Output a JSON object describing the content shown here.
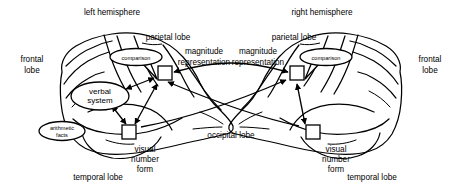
{
  "figure": {
    "type": "anatomical-diagram",
    "background_color": "#ffffff",
    "line_color": "#000000"
  },
  "titles": {
    "left_hemisphere": "left hemisphere",
    "right_hemisphere": "right hemisphere"
  },
  "lobes": {
    "frontal_left": "frontal\nlobe",
    "frontal_left_line1": "frontal",
    "frontal_left_line2": "lobe",
    "frontal_right_line1": "frontal",
    "frontal_right_line2": "lobe",
    "parietal_left": "parietal lobe",
    "parietal_right": "parietal lobe",
    "temporal_left": "temporal lobe",
    "temporal_right": "temporal lobe",
    "occipital": "occipital lobe"
  },
  "modules": {
    "comparison_left": "comparison",
    "comparison_right": "comparison",
    "verbal_system_line1": "verbal",
    "verbal_system_line2": "system",
    "arithmetic_facts_line1": "arithmetic",
    "arithmetic_facts_line2": "facts",
    "magnitude_left_line1": "magnitude",
    "magnitude_left_line2": "representation",
    "magnitude_right_line1": "magnitude",
    "magnitude_right_line2": "representation",
    "visual_number_form_left_line1": "visual",
    "visual_number_form_left_line2": "number",
    "visual_number_form_left_line3": "form",
    "visual_number_form_right_line1": "visual",
    "visual_number_form_right_line2": "number",
    "visual_number_form_right_line3": "form"
  },
  "connections": {
    "interhemispheric_magnitude": "double-headed arrow linking left and right magnitude representation",
    "left_magnitude_to_verbal": "double-headed arrow linking left magnitude representation and verbal system",
    "left_magnitude_to_vnf": "double-headed arrow linking left magnitude representation and left visual number form",
    "left_verbal_to_vnf": "double-headed arrow linking verbal system and left visual number form",
    "left_vnf_to_right_magnitude": "arrow from left visual number form toward right magnitude representation",
    "right_vnf_to_right_magnitude": "double-headed arrow linking right visual number form and right magnitude representation",
    "right_vnf_to_left_magnitude": "arrow from right visual number form toward left magnitude representation"
  }
}
